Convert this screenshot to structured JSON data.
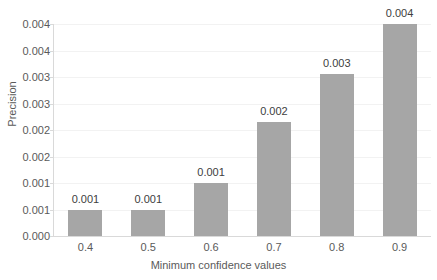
{
  "chart_data": {
    "type": "bar",
    "title": "",
    "xlabel": "Minimum confidence values",
    "ylabel": "Precision",
    "categories": [
      "0.4",
      "0.5",
      "0.6",
      "0.7",
      "0.8",
      "0.9"
    ],
    "values": [
      0.0005,
      0.0005,
      0.001,
      0.00215,
      0.00305,
      0.004
    ],
    "data_labels": [
      "0.001",
      "0.001",
      "0.001",
      "0.002",
      "0.003",
      "0.004"
    ],
    "ytick_labels": [
      "0.004",
      "0.004",
      "0.003",
      "0.003",
      "0.002",
      "0.002",
      "0.001",
      "0.001",
      "0.000"
    ],
    "ytick_values": [
      0.004,
      0.0035,
      0.003,
      0.0025,
      0.002,
      0.0015,
      0.001,
      0.0005,
      0.0
    ],
    "ylim": [
      0.0,
      0.004
    ],
    "grid": true,
    "legend": "none",
    "series_color": "#a6a6a6",
    "gridline_color": "#f2f2f2",
    "axis_color": "#d9d9d9",
    "label_color": "#5a5a5a"
  }
}
